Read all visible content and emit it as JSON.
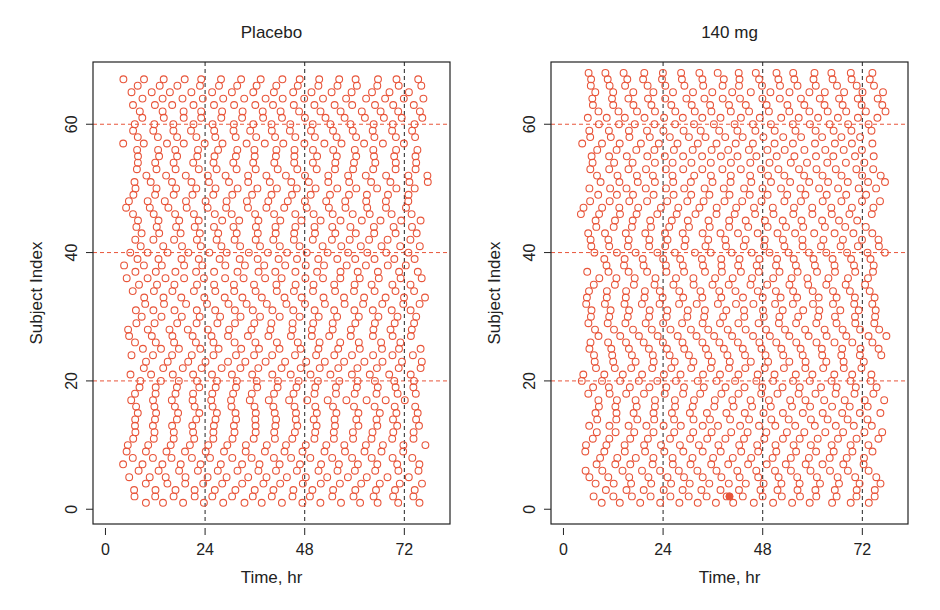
{
  "chart_data": [
    {
      "type": "scatter",
      "title": "Placebo",
      "xlabel": "Time, hr",
      "ylabel": "Subject Index",
      "xlim": [
        -3,
        83
      ],
      "ylim": [
        -2.3,
        69.7
      ],
      "xticks": [
        0,
        24,
        48,
        72
      ],
      "yticks": [
        0,
        20,
        40,
        60
      ],
      "vlines": [
        24,
        48,
        72
      ],
      "hlines": [
        20,
        40,
        60
      ],
      "n_subjects": 67,
      "sampling": {
        "start_range": [
          5,
          9
        ],
        "interval_hr": 4.8,
        "max_time": 77,
        "zigzag_period": 10,
        "zigzag_amp": 2.4
      },
      "marker": "open-circle",
      "marker_color": "#e8553a",
      "vline_color": "#222222",
      "hline_color": "#e8553a"
    },
    {
      "type": "scatter",
      "title": "140 mg",
      "xlabel": "Time, hr",
      "ylabel": "Subject Index",
      "xlim": [
        -3,
        83
      ],
      "ylim": [
        -2.3,
        69.7
      ],
      "xticks": [
        0,
        24,
        48,
        72
      ],
      "yticks": [
        0,
        20,
        40,
        60
      ],
      "vlines": [
        24,
        48,
        72
      ],
      "hlines": [
        20,
        40,
        60
      ],
      "n_subjects": 68,
      "sampling": {
        "start_range": [
          5,
          9
        ],
        "interval_hr": 4.6,
        "max_time": 77,
        "zigzag_period": 12,
        "zigzag_amp": 2.2
      },
      "marker": "open-circle",
      "marker_color": "#e8553a",
      "vline_color": "#222222",
      "hline_color": "#e8553a",
      "highlighted_point": {
        "x": 40,
        "y": 2
      }
    }
  ]
}
